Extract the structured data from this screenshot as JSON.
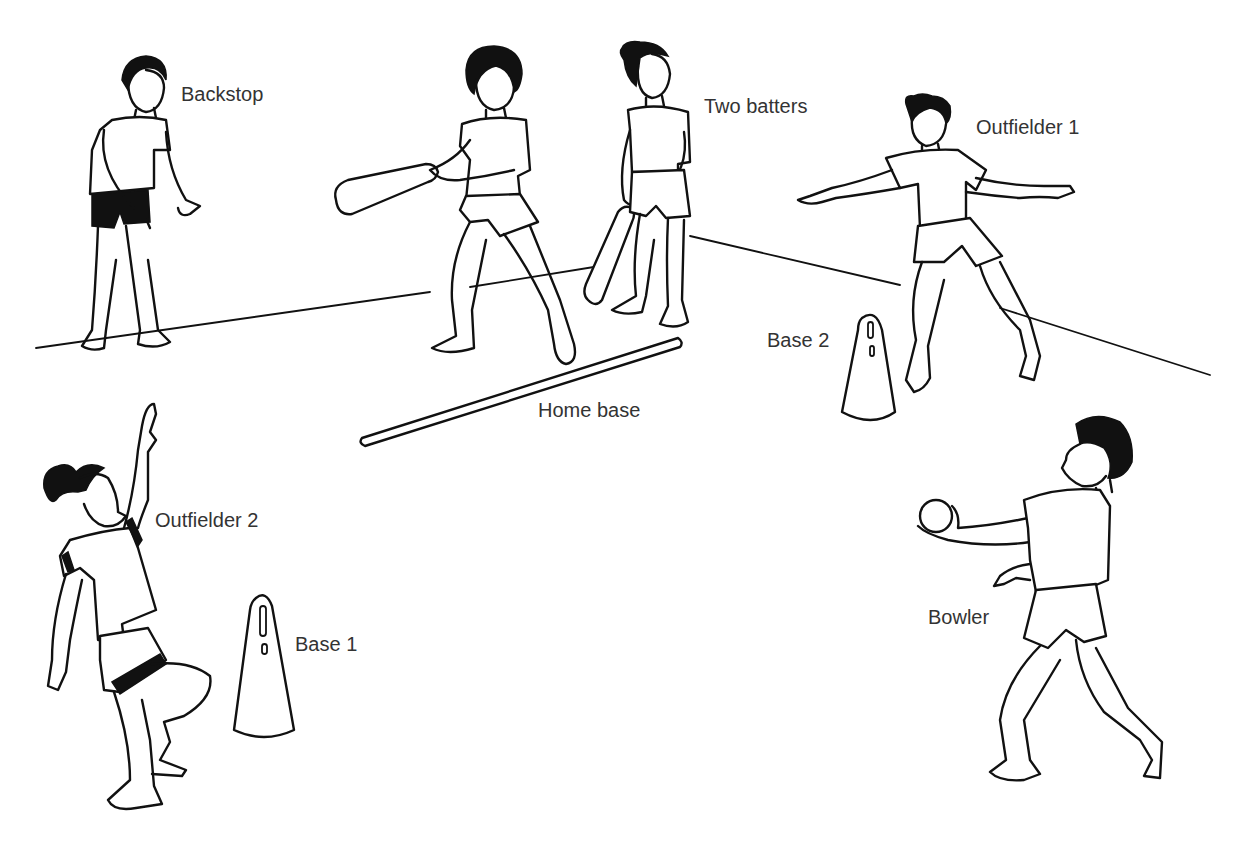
{
  "diagram": {
    "type": "illustration",
    "colors": {
      "ink": "#111111",
      "label": "#333333",
      "background": "#ffffff"
    },
    "labels": [
      {
        "id": "backstop",
        "text": "Backstop"
      },
      {
        "id": "two_batters",
        "text": "Two batters"
      },
      {
        "id": "outfielder_1",
        "text": "Outfielder 1"
      },
      {
        "id": "base_2",
        "text": "Base 2"
      },
      {
        "id": "home_base",
        "text": "Home base"
      },
      {
        "id": "outfielder_2",
        "text": "Outfielder 2"
      },
      {
        "id": "base_1",
        "text": "Base 1"
      },
      {
        "id": "bowler",
        "text": "Bowler"
      }
    ]
  }
}
